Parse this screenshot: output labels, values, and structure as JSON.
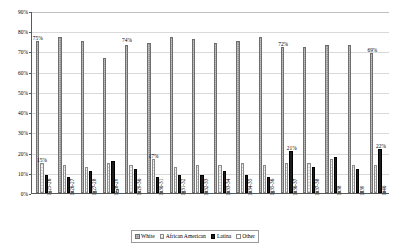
{
  "chart_data": {
    "type": "bar",
    "title": "",
    "xlabel": "",
    "ylabel": "",
    "ylim": [
      0,
      90
    ],
    "ytick_labels": [
      "90%",
      "80%",
      "70%",
      "60%",
      "50%",
      "40%",
      "30%",
      "20%",
      "10%",
      "0%"
    ],
    "ytick_values": [
      90,
      80,
      70,
      60,
      50,
      40,
      30,
      20,
      10,
      0
    ],
    "grid": true,
    "legend_position": "bottom",
    "categories": [
      "1925-26",
      "1926-27",
      "1927-28",
      "1928-29",
      "1929-30",
      "1930-31",
      "1931-32",
      "1932-33",
      "1933-34",
      "1934-35",
      "1935-36",
      "1936-37",
      "1937-38",
      "1938",
      "1939",
      "1940"
    ],
    "series": [
      {
        "name": "White",
        "values": [
          75,
          77,
          75,
          67,
          73,
          74,
          77,
          76,
          74,
          75,
          77,
          72,
          72,
          73,
          73,
          69
        ]
      },
      {
        "name": "African American",
        "values": [
          15,
          14,
          13,
          15,
          14,
          17,
          13,
          14,
          14,
          15,
          14,
          15,
          15,
          17,
          14,
          14
        ]
      },
      {
        "name": "Latina",
        "values": [
          9,
          8,
          11,
          16,
          12,
          8,
          9,
          9,
          11,
          9,
          8,
          21,
          13,
          18,
          12,
          22
        ]
      },
      {
        "name": "Other",
        "values": [
          1,
          1,
          1,
          2,
          1,
          1,
          1,
          1,
          1,
          1,
          1,
          1,
          1,
          1,
          1,
          1
        ]
      }
    ],
    "annotations": [
      {
        "text": "75%",
        "category": "1925-26",
        "series": "White",
        "value": 75
      },
      {
        "text": "15%",
        "category": "1925-26",
        "series": "African American",
        "value": 15
      },
      {
        "text": "74%",
        "category": "1929-30",
        "series": "White",
        "value": 74
      },
      {
        "text": "17%",
        "category": "1930-31",
        "series": "African American",
        "value": 17
      },
      {
        "text": "72%",
        "category": "1936-37",
        "series": "White",
        "value": 72
      },
      {
        "text": "21%",
        "category": "1936-37",
        "series": "Latina",
        "value": 21
      },
      {
        "text": "69%",
        "category": "1940",
        "series": "White",
        "value": 69
      },
      {
        "text": "22%",
        "category": "1940",
        "series": "Latina",
        "value": 22
      }
    ]
  },
  "legend": {
    "items": [
      {
        "label": "White",
        "color": "#8c8c8c"
      },
      {
        "label": "African American",
        "color": "#f2f2f2"
      },
      {
        "label": "Latina",
        "color": "#1c1c1c"
      },
      {
        "label": "Other",
        "color": "#ffffff"
      }
    ]
  }
}
